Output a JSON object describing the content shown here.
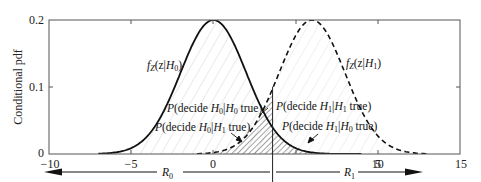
{
  "chart_data": {
    "type": "line",
    "title": "",
    "xlabel": "",
    "ylabel": "Conditional pdf",
    "xlim": [
      -10,
      15
    ],
    "ylim": [
      0,
      0.2
    ],
    "xticks": [
      -10,
      -5,
      0,
      5,
      10,
      15
    ],
    "xtick_labels": [
      "−10",
      "−5",
      "0",
      "5",
      "10",
      "15"
    ],
    "yticks": [
      0,
      0.1,
      0.2
    ],
    "ytick_labels": [
      "0",
      "0.1",
      "0.2"
    ],
    "grid": false,
    "legend": "none",
    "threshold": 3.6,
    "series": [
      {
        "name": "f_Z(z|H_0)",
        "distribution": "gaussian",
        "mean": 0,
        "std": 2,
        "peak": 0.2,
        "style": "solid"
      },
      {
        "name": "f_Z(z|H_1)",
        "distribution": "gaussian",
        "mean": 6,
        "std": 2,
        "peak": 0.2,
        "style": "dashed"
      }
    ],
    "regions": [
      {
        "name": "R_0",
        "from": -10,
        "to": 3.6,
        "arrow": "left"
      },
      {
        "name": "R_1",
        "from": 3.6,
        "to": 15,
        "arrow": "right"
      }
    ],
    "annotations": [
      "f_Z(z|H_0)",
      "f_Z(z|H_1)",
      "P(decide H_0|H_0 true)",
      "P(decide H_0|H_1 true)",
      "P(decide H_1|H_1 true)",
      "P(decide H_1|H_0 true)"
    ]
  },
  "labels": {
    "ylabel": "Conditional pdf",
    "y0": "0",
    "y1": "0.1",
    "y2": "0.2",
    "xm10": "−10",
    "xm5": "−5",
    "x0": "0",
    "x5": "5",
    "x10": "10",
    "x15": "15",
    "f0_pre": "f",
    "f0_sub": "Z",
    "f0_post": "(z|",
    "f0_H": "H",
    "f0_Hsub": "0",
    "f0_close": ")",
    "f1_pre": "f",
    "f1_sub": "Z",
    "f1_post": "(z|",
    "f1_H": "H",
    "f1_Hsub": "1",
    "f1_close": ")",
    "p_h0h0": {
      "P": "P",
      "mid": "(decide ",
      "H": "H",
      "s1": "0",
      "bar": "|",
      "H2": "H",
      "s2": "0",
      "end": " true)"
    },
    "p_h0h1": {
      "P": "P",
      "mid": "(decide ",
      "H": "H",
      "s1": "0",
      "bar": "|",
      "H2": "H",
      "s2": "1",
      "end": " true)"
    },
    "p_h1h1": {
      "P": "P",
      "mid": "(decide ",
      "H": "H",
      "s1": "1",
      "bar": "|",
      "H2": "H",
      "s2": "1",
      "end": " true)"
    },
    "p_h1h0": {
      "P": "P",
      "mid": "(decide ",
      "H": "H",
      "s1": "1",
      "bar": "|",
      "H2": "H",
      "s2": "0",
      "end": " true)"
    },
    "r0": "R",
    "r0_sub": "0",
    "r1": "R",
    "r1_sub": "1"
  }
}
